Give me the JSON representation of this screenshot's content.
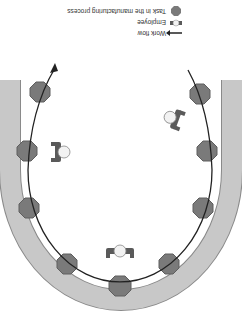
{
  "orientation": "rotated-180",
  "legend": {
    "items": [
      {
        "icon": "octagon-task-icon",
        "label": "Task in the manufacturing process"
      },
      {
        "icon": "employee-icon",
        "label": "Employee"
      },
      {
        "icon": "arrow-icon",
        "label": "Work flow"
      }
    ]
  },
  "colors": {
    "track": "#c4c4c4",
    "track_edge": "#8a8a8a",
    "task": "#7a7a7a",
    "task_edge": "#5e5e5e",
    "employee_body": "#5a5a5a",
    "employee_head": "#f2f2f2",
    "flow_line": "#222222"
  },
  "diagram": {
    "shape": "U-shaped manufacturing cell",
    "task_count": 11,
    "employee_count": 3
  }
}
